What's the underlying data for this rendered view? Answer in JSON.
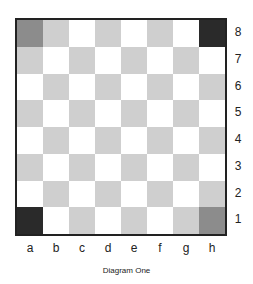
{
  "diagram": {
    "caption": "Diagram One",
    "files": [
      "a",
      "b",
      "c",
      "d",
      "e",
      "f",
      "g",
      "h"
    ],
    "ranks": [
      "8",
      "7",
      "6",
      "5",
      "4",
      "3",
      "2",
      "1"
    ],
    "colors": {
      "light_square": "#ffffff",
      "dark_square": "#cfcfcf",
      "highlight_dark": "#2a2a2a",
      "highlight_medium": "#8c8c8c",
      "border": "#222222"
    },
    "highlighted_squares": [
      {
        "square": "a8",
        "color": "#8c8c8c"
      },
      {
        "square": "h8",
        "color": "#2a2a2a"
      },
      {
        "square": "a1",
        "color": "#2a2a2a"
      },
      {
        "square": "h1",
        "color": "#8c8c8c"
      }
    ]
  }
}
